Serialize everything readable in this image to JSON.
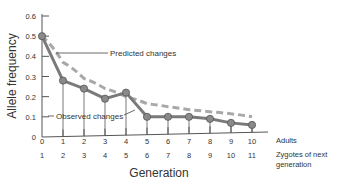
{
  "chart_data": {
    "type": "line",
    "title": "",
    "xlabel": "Generation",
    "ylabel": "Allele frequency",
    "x": [
      0,
      1,
      2,
      3,
      4,
      5,
      6,
      7,
      8,
      9,
      10
    ],
    "x_tick_labels_row1": [
      "0",
      "1",
      "2",
      "3",
      "4",
      "5",
      "6",
      "7",
      "8",
      "9",
      "10"
    ],
    "x_tick_labels_row2": [
      "1",
      "2",
      "3",
      "4",
      "5",
      "6",
      "7",
      "8",
      "9",
      "10",
      "11"
    ],
    "row1_label": "Adults",
    "row2_label_line1": "Zygotes of next",
    "row2_label_line2": "generation",
    "y_ticks": [
      0,
      0.1,
      0.2,
      0.3,
      0.4,
      0.5,
      0.6
    ],
    "y_tick_labels": [
      "0",
      "0.1",
      "0.2",
      "0.3",
      "0.4",
      "0.5",
      "0.6"
    ],
    "ylim": [
      0,
      0.6
    ],
    "xlim": [
      0,
      10
    ],
    "grid": false,
    "series": [
      {
        "name": "Observed changes",
        "style": "solid-with-markers",
        "color": "#7a7a7a",
        "values": [
          0.5,
          0.28,
          0.24,
          0.19,
          0.22,
          0.1,
          0.1,
          0.1,
          0.09,
          0.07,
          0.06
        ]
      },
      {
        "name": "Predicted changes",
        "style": "dashed",
        "color": "#a8a8a8",
        "values": [
          0.5,
          0.37,
          0.29,
          0.24,
          0.2,
          0.165,
          0.15,
          0.135,
          0.125,
          0.115,
          0.1
        ]
      }
    ],
    "annotations": [
      {
        "text": "Predicted changes",
        "points_to": "Predicted changes",
        "position": "upper-middle"
      },
      {
        "text": "Observed changes",
        "points_to": "Observed changes",
        "position": "lower-left"
      }
    ]
  }
}
